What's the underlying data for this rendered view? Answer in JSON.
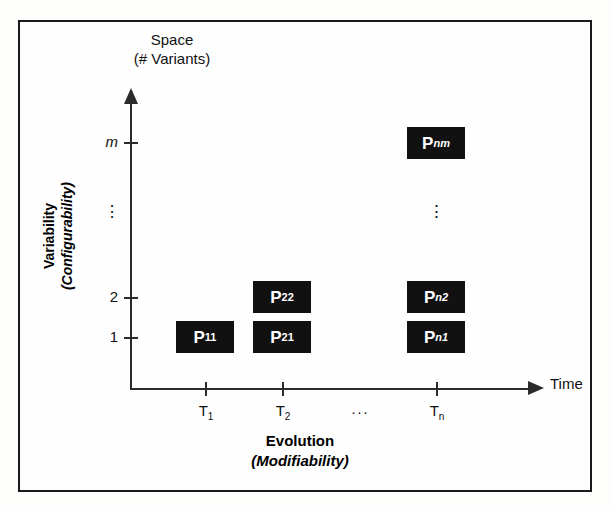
{
  "figure": {
    "type": "diagram",
    "title_top": {
      "line1": "Space",
      "line2": "(# Variants)"
    },
    "y_axis": {
      "label_main": "Variability",
      "label_paren": "(Configurability)",
      "ticks": [
        {
          "id": "y-m",
          "label": "m",
          "italic": true
        },
        {
          "id": "y-dots",
          "label": "⋮",
          "italic": false
        },
        {
          "id": "y-2",
          "label": "2",
          "italic": false
        },
        {
          "id": "y-1",
          "label": "1",
          "italic": false
        }
      ]
    },
    "x_axis": {
      "arrow_label": "Time",
      "label_main": "Evolution",
      "label_paren": "(Modifiability)",
      "ticks": [
        {
          "id": "x-t1",
          "base": "T",
          "sub": "1",
          "sub_italic": false
        },
        {
          "id": "x-t2",
          "base": "T",
          "sub": "2",
          "sub_italic": false
        },
        {
          "id": "x-tn",
          "base": "T",
          "sub": "n",
          "sub_italic": false
        }
      ],
      "ellipsis": "···"
    },
    "boxes": [
      {
        "id": "p11",
        "base": "P",
        "sub": "11",
        "sub_italic": false,
        "x": 1,
        "y": 1
      },
      {
        "id": "p21",
        "base": "P",
        "sub": "21",
        "sub_italic": false,
        "x": 2,
        "y": 1
      },
      {
        "id": "p22",
        "base": "P",
        "sub": "22",
        "sub_italic": false,
        "x": 2,
        "y": 2
      },
      {
        "id": "pn1",
        "base": "P",
        "sub": "n1",
        "sub_italic": true,
        "x": 3,
        "y": 1
      },
      {
        "id": "pn2",
        "base": "P",
        "sub": "n2",
        "sub_italic": true,
        "x": 3,
        "y": 2
      },
      {
        "id": "pnm",
        "base": "P",
        "sub": "nm",
        "sub_italic": true,
        "x": 3,
        "y": 4
      }
    ],
    "column_ellipsis": "⋮",
    "colors": {
      "box_fill": "#111111",
      "box_text": "#ffffff",
      "axis": "#2b2b2b",
      "frame": "#1a1a1a",
      "background": "#fefefe"
    }
  }
}
